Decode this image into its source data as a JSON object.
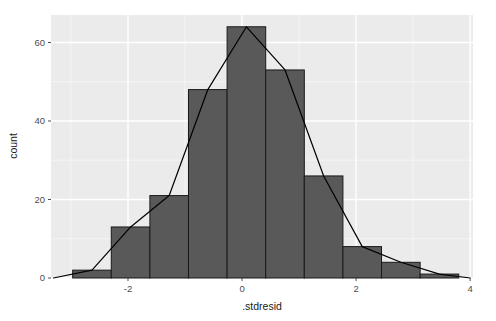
{
  "chart_data": {
    "type": "bar",
    "title": "",
    "subtitle": "",
    "xlabel": ".stdresid",
    "ylabel": "count",
    "xlim": [
      -3.35,
      4.05
    ],
    "ylim": [
      0,
      67
    ],
    "grid": true,
    "legend": "none",
    "x_ticks": [
      -2,
      0,
      2,
      4
    ],
    "x_tick_labels": [
      "-2",
      "0",
      "2",
      "4"
    ],
    "x_minor_ticks": [
      -3,
      -1,
      1,
      3
    ],
    "y_ticks": [
      0,
      20,
      40,
      60
    ],
    "y_tick_labels": [
      "0",
      "20",
      "40",
      "60"
    ],
    "y_minor_ticks": [
      10,
      30,
      50
    ],
    "bin_width": 0.677,
    "bins": [
      {
        "x_min": -2.97,
        "x_max": -2.293,
        "center": -2.631,
        "count": 2
      },
      {
        "x_min": -2.293,
        "x_max": -1.616,
        "center": -1.954,
        "count": 13
      },
      {
        "x_min": -1.616,
        "x_max": -0.939,
        "center": -1.277,
        "count": 21
      },
      {
        "x_min": -0.939,
        "x_max": -0.262,
        "center": -0.6,
        "count": 48
      },
      {
        "x_min": -0.262,
        "x_max": 0.415,
        "center": 0.077,
        "count": 64
      },
      {
        "x_min": 0.415,
        "x_max": 1.092,
        "center": 0.754,
        "count": 53
      },
      {
        "x_min": 1.092,
        "x_max": 1.769,
        "center": 1.431,
        "count": 26
      },
      {
        "x_min": 1.769,
        "x_max": 2.446,
        "center": 2.108,
        "count": 8
      },
      {
        "x_min": 2.446,
        "x_max": 3.123,
        "center": 2.785,
        "count": 4
      },
      {
        "x_min": 3.123,
        "x_max": 3.8,
        "center": 3.462,
        "count": 1
      }
    ],
    "categories": [
      "-2.63",
      "-1.95",
      "-1.28",
      "-0.60",
      "0.08",
      "0.75",
      "1.43",
      "2.11",
      "2.79",
      "3.46"
    ],
    "values": [
      2,
      13,
      21,
      48,
      64,
      53,
      26,
      8,
      4,
      1
    ],
    "overlay": {
      "type": "line",
      "name": "frequency polygon",
      "x": [
        -3.308,
        -2.631,
        -1.954,
        -1.277,
        -0.6,
        0.077,
        0.754,
        1.431,
        2.108,
        2.785,
        3.462,
        4.0
      ],
      "y": [
        0,
        2,
        13,
        21,
        48,
        64,
        53,
        26,
        8,
        4,
        1,
        0
      ],
      "color": "#000000"
    },
    "colors": {
      "panel_background": "#ebebeb",
      "grid_major": "#ffffff",
      "grid_minor": "#f5f5f5",
      "bar_fill": "#595959",
      "bar_outline": "#1a1a1a",
      "line": "#000000",
      "axis_text": "#4d4d4d",
      "axis_title": "#1a1a1a",
      "plot_background": "#ffffff"
    }
  },
  "axes": {
    "x_title": ".stdresid",
    "y_title": "count"
  }
}
